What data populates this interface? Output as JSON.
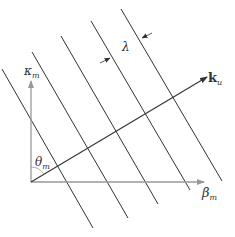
{
  "diagram": {
    "labels": {
      "kappa": "κ",
      "kappa_sub": "m",
      "beta": "β",
      "beta_sub": "m",
      "theta": "θ",
      "theta_sub": "m",
      "k": "k",
      "k_sub": "u",
      "lambda": "λ"
    },
    "colors": {
      "wavefront": "#333333",
      "axis": "#999999",
      "vector": "#333333"
    },
    "wavefront_count": 5
  }
}
